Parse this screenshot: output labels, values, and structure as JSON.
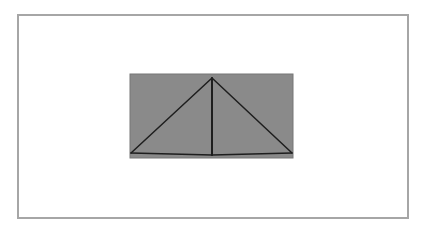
{
  "diagram": {
    "frame": {
      "border_color": "#a6a6a6",
      "background": "#ffffff"
    },
    "rectangle": {
      "x": 130,
      "y": 74,
      "width": 163,
      "height": 84,
      "fill": "#8a8a8a",
      "stroke": "#777777"
    },
    "lines": [
      {
        "name": "left-diagonal",
        "x1": 131,
        "y1": 153,
        "x2": 212,
        "y2": 78
      },
      {
        "name": "right-diagonal",
        "x1": 212,
        "y1": 78,
        "x2": 292,
        "y2": 153
      },
      {
        "name": "vertical-center",
        "x1": 212,
        "y1": 78,
        "x2": 212,
        "y2": 155
      },
      {
        "name": "base-left",
        "x1": 131,
        "y1": 153,
        "x2": 212,
        "y2": 155
      },
      {
        "name": "base-right",
        "x1": 212,
        "y1": 155,
        "x2": 292,
        "y2": 153
      }
    ],
    "line_color": "#1e1e1e"
  }
}
